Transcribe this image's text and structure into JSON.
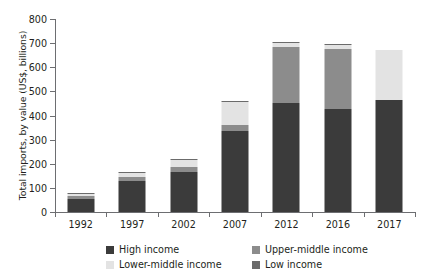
{
  "chart_data": {
    "type": "bar",
    "subtype": "stacked",
    "title": "",
    "xlabel": "",
    "ylabel": "Total imports, by value (US$, billions)",
    "categories": [
      "1992",
      "1997",
      "2002",
      "2007",
      "2012",
      "2016",
      "2017"
    ],
    "series": [
      {
        "name": "High income",
        "color": "#3b3b3b",
        "values": [
          55,
          130,
          165,
          335,
          450,
          425,
          465
        ]
      },
      {
        "name": "Upper-middle income",
        "color": "#8c8c8c",
        "values": [
          10,
          14,
          20,
          25,
          235,
          250,
          0
        ]
      },
      {
        "name": "Lower-middle income",
        "color": "#e3e3e3",
        "values": [
          10,
          16,
          32,
          98,
          15,
          18,
          205
        ]
      },
      {
        "name": "Low income",
        "color": "#6b6b6b",
        "values": [
          5,
          5,
          3,
          2,
          5,
          2,
          0
        ]
      }
    ],
    "totals": [
      80,
      165,
      220,
      460,
      705,
      695,
      670
    ],
    "ylim": [
      0,
      800
    ],
    "yticks": [
      0,
      100,
      200,
      300,
      400,
      500,
      600,
      700,
      800
    ],
    "ytick_labels": [
      "0",
      "100",
      "200",
      "300",
      "400",
      "500",
      "600",
      "700",
      "800"
    ],
    "grid": false,
    "legend_position": "bottom",
    "legend_entries": [
      {
        "label": "High income",
        "color": "#3b3b3b"
      },
      {
        "label": "Upper-middle income",
        "color": "#8c8c8c"
      },
      {
        "label": "Lower-middle income",
        "color": "#e3e3e3"
      },
      {
        "label": "Low income",
        "color": "#6b6b6b"
      }
    ]
  },
  "axis": {
    "y_title": "Total imports, by value (US$, billions)",
    "axis_color": "#6d6e71"
  }
}
